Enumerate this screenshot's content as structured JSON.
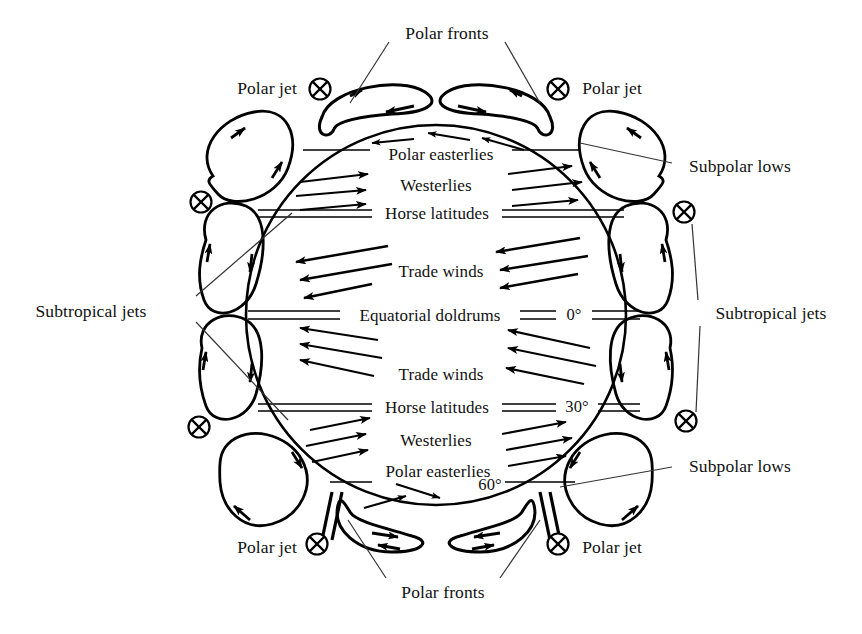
{
  "diagram": {
    "type": "schematic",
    "colors": {
      "ink": "#000000",
      "background": "#ffffff",
      "leader": "#333333"
    },
    "globe": {
      "center_x": 436,
      "center_y": 315,
      "radius": 190
    }
  },
  "inner_labels": {
    "polar_easterlies_north": "Polar easterlies",
    "westerlies_north": "Westerlies",
    "horse_latitudes_north": "Horse latitudes",
    "trade_winds_north": "Trade winds",
    "equatorial_doldrums": "Equatorial doldrums",
    "trade_winds_south": "Trade winds",
    "horse_latitudes_south": "Horse latitudes",
    "westerlies_south": "Westerlies",
    "polar_easterlies_south": "Polar easterlies"
  },
  "latitudes": {
    "equator": "0°",
    "horse": "30°",
    "polar": "60°"
  },
  "outer_labels": {
    "polar_fronts_top": "Polar fronts",
    "polar_fronts_bottom": "Polar fronts",
    "polar_jet_top_left": "Polar jet",
    "polar_jet_top_right": "Polar jet",
    "polar_jet_bottom_left": "Polar jet",
    "polar_jet_bottom_right": "Polar jet",
    "subpolar_lows_top_right": "Subpolar lows",
    "subpolar_lows_bottom_right": "Subpolar lows",
    "subtropical_jets_left": "Subtropical jets",
    "subtropical_jets_right": "Subtropical jets"
  },
  "jet_symbol": {
    "glyph": "⊗",
    "meaning": "jet stream into page",
    "count": 8
  },
  "wind_belts": [
    {
      "name": "Polar easterlies",
      "hemisphere": "north",
      "direction": "east-to-west"
    },
    {
      "name": "Westerlies",
      "hemisphere": "north",
      "direction": "west-to-east"
    },
    {
      "name": "Horse latitudes",
      "hemisphere": "north",
      "direction": "calm",
      "latitude": "30°"
    },
    {
      "name": "Trade winds",
      "hemisphere": "north",
      "direction": "east-to-west"
    },
    {
      "name": "Equatorial doldrums",
      "hemisphere": "equator",
      "direction": "calm",
      "latitude": "0°"
    },
    {
      "name": "Trade winds",
      "hemisphere": "south",
      "direction": "east-to-west"
    },
    {
      "name": "Horse latitudes",
      "hemisphere": "south",
      "direction": "calm",
      "latitude": "30°"
    },
    {
      "name": "Westerlies",
      "hemisphere": "south",
      "direction": "west-to-east"
    },
    {
      "name": "Polar easterlies",
      "hemisphere": "south",
      "direction": "east-to-west",
      "latitude": "60°"
    }
  ]
}
